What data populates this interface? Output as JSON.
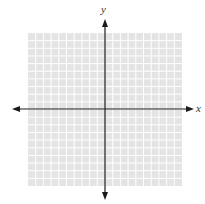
{
  "figure": {
    "title_fragment": "",
    "type": "coordinate-plane",
    "x_axis_label": "x",
    "y_axis_label": "y",
    "grid": {
      "columns": 20,
      "rows": 20,
      "left": 28,
      "top": 33,
      "width": 154,
      "height": 153,
      "cell_color": "#e4e4e4",
      "line_color": "#ffffff"
    },
    "axes": {
      "origin_x": 105,
      "origin_y": 109,
      "x_start": 12,
      "x_end": 194,
      "y_start": 19,
      "y_end": 200,
      "color": "#1a1a1a",
      "arrows": "both-ends"
    }
  }
}
